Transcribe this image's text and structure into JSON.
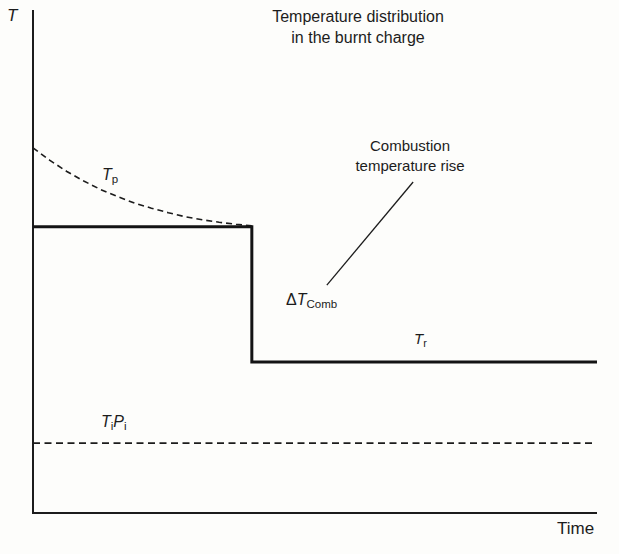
{
  "figure": {
    "title_line1": "Temperature distribution",
    "title_line2": "in the burnt charge",
    "y_axis_label": "T",
    "x_axis_label": "Time"
  },
  "annotation": {
    "line1": "Combustion",
    "line2": "temperature rise",
    "delta_symbol": "Δ",
    "delta_base": "T",
    "delta_sub": "Comb"
  },
  "curve_labels": {
    "tp_base": "T",
    "tp_sub": "p",
    "tr_base": "T",
    "tr_sub": "r",
    "tipi_t": "T",
    "tipi_t_sub": "i",
    "tipi_p": "P",
    "tipi_p_sub": "i"
  },
  "colors": {
    "ink": "#1c1c1c",
    "thick_line": "#141414",
    "background": "#fdfdfb"
  },
  "chart_data": {
    "type": "line",
    "title": "Temperature distribution in the burnt charge",
    "xlabel": "Time",
    "ylabel": "T",
    "grid": false,
    "legend": "none (inline curve labels)",
    "axis_note": "schematic sketch; no numeric ticks; coordinates below are normalized 0-100 on both axes",
    "xlim": [
      0,
      100
    ],
    "ylim": [
      0,
      100
    ],
    "series": [
      {
        "name": "Tp",
        "description": "first-burned gas temperature, dashed exponential decay merging into plateau",
        "style": "dashed",
        "dash": "6 4",
        "width": 1.6,
        "points": [
          [
            0,
            72.6
          ],
          [
            3,
            70.1
          ],
          [
            6,
            67.9
          ],
          [
            9,
            66.0
          ],
          [
            12,
            64.3
          ],
          [
            15,
            62.9
          ],
          [
            18,
            61.6
          ],
          [
            21,
            60.6
          ],
          [
            24,
            59.7
          ],
          [
            27,
            58.9
          ],
          [
            30,
            58.3
          ],
          [
            33,
            57.8
          ],
          [
            36,
            57.4
          ],
          [
            38.8,
            57.1
          ]
        ]
      },
      {
        "name": "burnt-charge-step",
        "description": "mean burnt-charge temperature: plateau, vertical drop of ΔTComb at ~38.8% of time span, then plateau Tr",
        "style": "solid",
        "width": 3,
        "points": [
          [
            0,
            56.9
          ],
          [
            38.8,
            56.9
          ],
          [
            38.8,
            30.0
          ],
          [
            100,
            30.0
          ]
        ]
      },
      {
        "name": "TiPi",
        "description": "initial temperature-pressure reference level, dashed horizontal line",
        "style": "dashed",
        "dash": "7 4.5",
        "width": 1.8,
        "points": [
          [
            0,
            13.9
          ],
          [
            99.8,
            13.9
          ]
        ]
      }
    ],
    "annotations": [
      {
        "text": "Combustion temperature rise",
        "symbol": "ΔTComb",
        "leader_line": [
          [
            67.4,
            65.8
          ],
          [
            52.1,
            45.3
          ]
        ],
        "leader_width": 1.3
      }
    ]
  }
}
